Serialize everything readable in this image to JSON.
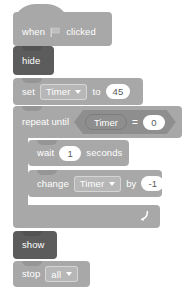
{
  "script": {
    "title": "Scratch block script",
    "blocks": [
      {
        "id": "when-flag-clicked",
        "type": "hat",
        "category": "events",
        "label_before": "when",
        "icon": "green-flag-icon",
        "label_after": "clicked"
      },
      {
        "id": "hide",
        "type": "stack",
        "category": "looks",
        "label": "hide"
      },
      {
        "id": "set-variable",
        "type": "stack",
        "category": "variables",
        "label_before": "set",
        "variable": "Timer",
        "label_mid": "to",
        "value": "45"
      },
      {
        "id": "repeat-until",
        "type": "c-block",
        "category": "control",
        "label": "repeat until",
        "condition": {
          "operator": "=",
          "left": "Timer",
          "right": "0"
        }
      },
      {
        "id": "wait-seconds",
        "type": "stack",
        "category": "control",
        "label_before": "wait",
        "value": "1",
        "label_after": "seconds"
      },
      {
        "id": "change-variable",
        "type": "stack",
        "category": "variables",
        "label_before": "change",
        "variable": "Timer",
        "label_mid": "by",
        "value": "-1"
      },
      {
        "id": "show",
        "type": "stack",
        "category": "looks",
        "label": "show"
      },
      {
        "id": "stop",
        "type": "cap",
        "category": "control",
        "label": "stop",
        "option": "all"
      }
    ]
  },
  "text": {
    "when": "when",
    "clicked": "clicked",
    "hide": "hide",
    "set": "set",
    "to": "to",
    "timer": "Timer",
    "value_45": "45",
    "repeat_until": "repeat until",
    "timer_var": "Timer",
    "equals": "=",
    "value_0": "0",
    "wait": "wait",
    "value_1": "1",
    "seconds": "seconds",
    "change": "change",
    "timer2": "Timer",
    "by": "by",
    "value_neg1": "-1",
    "show": "show",
    "stop": "stop",
    "all": "all"
  },
  "colors": {
    "background": "#ffffff",
    "block_light": "#a8a8a8",
    "block_dark": "#5c5c5c",
    "variable_oval": "#8e8e8e",
    "input_white": "#ffffff",
    "label_text": "#ffffff",
    "input_text": "#5a5a5a"
  }
}
